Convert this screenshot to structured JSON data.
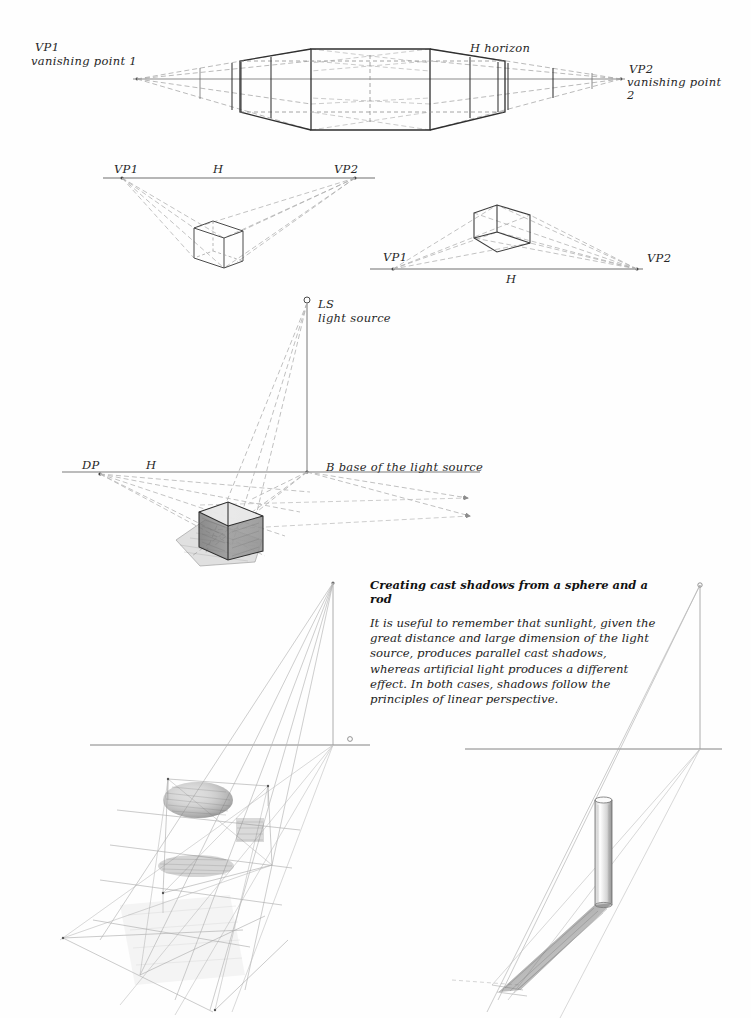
{
  "page": {
    "background_color": "#fefefe",
    "ink_color": "#2b2b2b",
    "guide_color": "#9a9a9a",
    "light_guide_color": "#b9b9b9"
  },
  "figures": [
    {
      "id": "two-point-perspective-eye-level",
      "labels": {
        "vp1": "VP1",
        "vp1_full": "vanishing point 1",
        "horizon": "H horizon",
        "vp2": "VP2",
        "vp2_full_line1": "vanishing point",
        "vp2_full_line2": "2"
      }
    },
    {
      "id": "cube-below-horizon",
      "labels": {
        "vp1": "VP1",
        "horizon": "H",
        "vp2": "VP2"
      }
    },
    {
      "id": "box-above-horizon",
      "labels": {
        "vp1": "VP1",
        "horizon": "H",
        "vp2": "VP2"
      }
    },
    {
      "id": "cast-shadow-from-cube",
      "labels": {
        "light_source_abbr": "LS",
        "light_source_full": "light source",
        "dp": "DP",
        "horizon": "H",
        "base": "B base of the light source"
      }
    },
    {
      "id": "cast-shadow-sphere",
      "labels": {}
    },
    {
      "id": "cast-shadow-rod",
      "labels": {}
    }
  ],
  "caption": {
    "title": "Creating cast shadows from a sphere and a rod",
    "body": "It is useful to remember that sunlight, given the great distance and large dimension of the light source, produces parallel cast shadows, whereas artificial light produces a different effect. In both cases, shadows follow the principles of linear perspective."
  }
}
